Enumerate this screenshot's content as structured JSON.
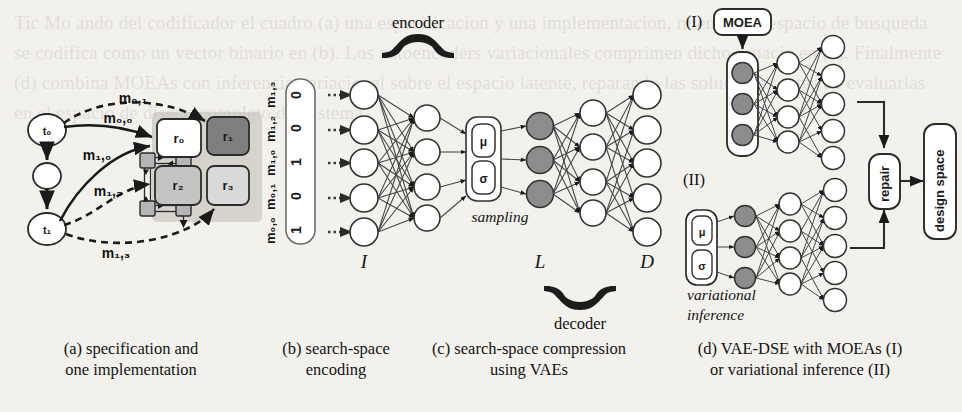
{
  "figure": {
    "panels": [
      {
        "id": "a",
        "caption_line1": "(a) specification and",
        "caption_line2": "one implementation",
        "task_nodes": [
          {
            "id": "t0",
            "label": "t₀"
          },
          {
            "id": "tmid",
            "label": ""
          },
          {
            "id": "t1",
            "label": "t₁"
          }
        ],
        "mapping_labels": [
          {
            "id": "m01",
            "label": "m₀,₁",
            "style": "dashed"
          },
          {
            "id": "m00",
            "label": "m₀,₀",
            "style": "solid"
          },
          {
            "id": "m10",
            "label": "m₁,₀",
            "style": "solid"
          },
          {
            "id": "m12",
            "label": "m₁,₂",
            "style": "dashed"
          },
          {
            "id": "m13",
            "label": "m₁,₃",
            "style": "dashed"
          }
        ],
        "resources": [
          {
            "id": "r0",
            "label": "r₀",
            "fill": "#ffffff"
          },
          {
            "id": "r1",
            "label": "r₁",
            "fill": "#7f7f7f"
          },
          {
            "id": "r2",
            "label": "r₂",
            "fill": "#c4c4c4"
          },
          {
            "id": "r3",
            "label": "r₃",
            "fill": "#d9d9d9"
          }
        ]
      },
      {
        "id": "b",
        "caption_line1": "(b) search-space",
        "caption_line2": "encoding",
        "vector_labels_bottom_to_top": [
          "m₀,₀",
          "m₀,₁",
          "m₁,₀",
          "m₁,₂",
          "m₁,₃"
        ],
        "vector_values_bottom_to_top": [
          "1",
          "0",
          "1",
          "0",
          "0"
        ]
      },
      {
        "id": "c",
        "caption_line1": "(c) search-space compression",
        "caption_line2": "using VAEs",
        "brace_top_label": "encoder",
        "brace_bottom_label": "decoder",
        "sampling_label": "sampling",
        "mu_label": "μ",
        "sigma_label": "σ",
        "layer_labels": {
          "input": "I",
          "latent": "L",
          "output": "D"
        },
        "layer_sizes": {
          "input": 5,
          "enc_hidden": 4,
          "latent": 3,
          "dec_hidden": 4,
          "output": 5
        }
      },
      {
        "id": "d",
        "caption_line1": "(d) VAE-DSE with MOEAs (I)",
        "caption_line2": "or variational inference (II)",
        "variant_I_label": "(I)",
        "variant_II_label": "(II)",
        "moea_label": "MOEA",
        "variational_label_line1": "variational",
        "variational_label_line2": "inference",
        "mu_label": "μ",
        "sigma_label": "σ",
        "repair_label": "repair",
        "design_space_label": "design space",
        "layer_sizes": {
          "latent": 3,
          "hidden": 4,
          "output": 5
        }
      }
    ]
  },
  "colors": {
    "background": "#f3f1ec",
    "ink": "#1a1a1a",
    "node_fill": "#ffffff",
    "latent_fill": "#8c8c8c",
    "resource_dark": "#7f7f7f",
    "resource_mid": "#c4c4c4",
    "resource_light": "#d9d9d9",
    "connector_fill": "#b5b5b5",
    "shadow": "#a8a49d"
  },
  "bleed_text": "Tic Mo ando del codificador el cuadro (a) una especificacion y una implementacion, mientras el espacio de busqueda se codifica como un vector binario en (b). Los autoencoders variacionales comprimen dicho espacio en (c). Finalmente (d) combina MOEAs con inferencia variacional sobre el espacio latente, reparando las soluciones antes de evaluarlas en el espacio de diseno completo del sistema."
}
